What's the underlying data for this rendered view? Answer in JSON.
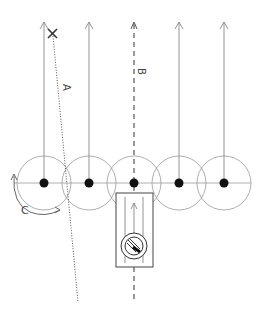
{
  "diagram": {
    "labels": {
      "a": "A",
      "b": "B",
      "c": "C"
    },
    "marker": "×",
    "colors": {
      "line": "#888888",
      "dark": "#111111",
      "circle": "#999999"
    },
    "elements": {
      "circles": 5,
      "arrows_up": 4,
      "dashed_line": "B",
      "dotted_line": "A",
      "rotation_arrow": "C",
      "device_box": 1
    }
  }
}
